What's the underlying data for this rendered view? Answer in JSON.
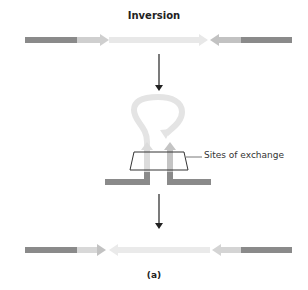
{
  "title": "Inversion",
  "caption": "(a)",
  "annotation": "Sites of exchange",
  "colors": {
    "flank": "#8a8a8a",
    "site_dark": "#a8a8a8",
    "site_light": "#cfcfcf",
    "inverted": "#e6e6e6",
    "arrow": "#222222",
    "box": "#333333"
  }
}
